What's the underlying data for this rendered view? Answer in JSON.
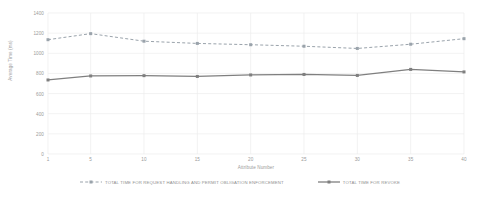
{
  "chart_data": {
    "type": "line",
    "title": "",
    "xlabel": "Attribute Number",
    "ylabel": "Average Time (ms)",
    "x": [
      1,
      5,
      10,
      15,
      20,
      25,
      30,
      35,
      40
    ],
    "categories": [
      "1",
      "5",
      "10",
      "15",
      "20",
      "25",
      "30",
      "35",
      "40"
    ],
    "xlim": [
      1,
      40
    ],
    "ylim": [
      0,
      1400
    ],
    "y_ticks": [
      0,
      200,
      400,
      600,
      800,
      1000,
      1200,
      1400
    ],
    "y_tick_labels": [
      "0",
      "200",
      "400",
      "600",
      "800",
      "1000",
      "1200",
      "1400"
    ],
    "grid": true,
    "legend_position": "bottom",
    "series": [
      {
        "name": "TOTAL TIME FOR REQUEST HANDLING AND PERMIT OBLIGATION ENFORCEMENT",
        "style": "dashed",
        "color": "#9aa3ab",
        "marker": "square",
        "values": [
          1135,
          1195,
          1120,
          1098,
          1085,
          1070,
          1048,
          1090,
          1145
        ]
      },
      {
        "name": "TOTAL TIME FOR REVOKE",
        "style": "solid",
        "color": "#7f7f7f",
        "marker": "square",
        "values": [
          735,
          775,
          778,
          770,
          785,
          790,
          780,
          840,
          815
        ]
      }
    ]
  },
  "legend": {
    "entries": [
      {
        "label": "TOTAL TIME FOR REQUEST HANDLING AND PERMIT OBLIGATION ENFORCEMENT"
      },
      {
        "label": "TOTAL TIME FOR REVOKE"
      }
    ]
  },
  "colors": {
    "dashed_series": "#9aa3ab",
    "solid_series": "#7f7f7f",
    "grid": "#ececec",
    "text": "#9a9a9a",
    "background": "#ffffff"
  }
}
